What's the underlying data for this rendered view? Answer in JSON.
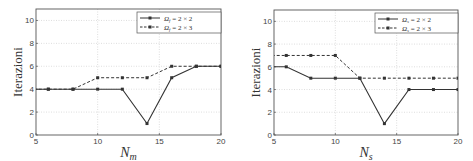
{
  "chart_data": [
    {
      "type": "line",
      "title": "",
      "xlabel": "N_m",
      "xlabel_main": "N",
      "xlabel_sub": "m",
      "ylabel": "Iterazioni",
      "xlim": [
        5,
        20
      ],
      "ylim": [
        0,
        11
      ],
      "xticks": [
        5,
        10,
        15,
        20
      ],
      "yticks": [
        0,
        2,
        4,
        6,
        8,
        10
      ],
      "grid": true,
      "legend_position": "upper right",
      "x": [
        4,
        6,
        8,
        10,
        12,
        14,
        16,
        18,
        20
      ],
      "series": [
        {
          "name": "Ω_f = 2 × 2",
          "sym": "Ω",
          "sub": "f",
          "rhs": " = 2 × 2",
          "style": "solid",
          "color": "#333333",
          "values": [
            4,
            4,
            4,
            4,
            4,
            1,
            5,
            6,
            6
          ]
        },
        {
          "name": "Ω_f = 2 × 3",
          "sym": "Ω",
          "sub": "f",
          "rhs": " = 2 × 3",
          "style": "dashed",
          "color": "#333333",
          "values": [
            4,
            4,
            4,
            5,
            5,
            5,
            6,
            6,
            6
          ]
        }
      ],
      "box": {
        "x0": 36,
        "x1": 221,
        "y0": 9,
        "y1": 135
      },
      "legend_box": {
        "x": 137,
        "y": 12,
        "w": 84,
        "h": 21
      }
    },
    {
      "type": "line",
      "title": "",
      "xlabel": "N_s",
      "xlabel_main": "N",
      "xlabel_sub": "s",
      "ylabel": "Iterazioni",
      "xlim": [
        5,
        20
      ],
      "ylim": [
        0,
        11
      ],
      "xticks": [
        5,
        10,
        15,
        20
      ],
      "yticks": [
        0,
        2,
        4,
        6,
        8,
        10
      ],
      "grid": true,
      "legend_position": "upper right",
      "x": [
        4,
        6,
        8,
        10,
        12,
        14,
        16,
        18,
        20
      ],
      "series": [
        {
          "name": "Ω_s = 2 × 2",
          "sym": "Ω",
          "sub": "s",
          "rhs": " = 2 × 2",
          "style": "solid",
          "color": "#333333",
          "values": [
            6,
            6,
            5,
            5,
            5,
            1,
            4,
            4,
            4
          ]
        },
        {
          "name": "Ω_s = 2 × 3",
          "sym": "Ω",
          "sub": "s",
          "rhs": " = 2 × 3",
          "style": "dashed",
          "color": "#333333",
          "values": [
            7,
            7,
            7,
            7,
            5,
            5,
            5,
            5,
            5
          ]
        }
      ],
      "box": {
        "x0": 274,
        "x1": 458,
        "y0": 10,
        "y1": 135
      },
      "legend_box": {
        "x": 375,
        "y": 13,
        "w": 83,
        "h": 20
      }
    }
  ]
}
